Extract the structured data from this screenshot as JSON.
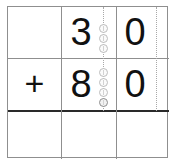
{
  "worksheet": {
    "type": "vertical-addition",
    "problem": "30 + 80",
    "columns": [
      "operator",
      "tens",
      "ones"
    ],
    "rules": {
      "answer_line_color": "#2a2a2a",
      "grid_line_color": "#8f8f8f",
      "guide_line_color": "#a8a8a8"
    },
    "rows": [
      {
        "name": "first-addend",
        "operator": "",
        "tens": "3",
        "ones": "0",
        "tens_markers": 3,
        "ones_markers": 0
      },
      {
        "name": "second-addend",
        "operator": "+",
        "tens": "8",
        "ones": "0",
        "tens_markers": 4,
        "ones_markers": 0
      },
      {
        "name": "answer",
        "operator": "",
        "tens": "",
        "ones": "",
        "tens_markers": 0,
        "ones_markers": 0
      }
    ],
    "markers": {
      "tens_row1": [
        "counter-dot",
        "counter-dot",
        "counter-dot"
      ],
      "tens_row2": [
        "counter-dot",
        "counter-dot",
        "counter-dot",
        "counter-dot-filled"
      ]
    }
  }
}
